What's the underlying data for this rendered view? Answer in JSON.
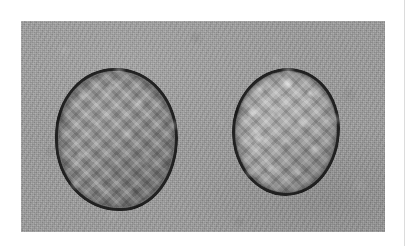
{
  "page": {
    "background_color": "#ffffff",
    "width": 411,
    "height": 246,
    "column_rule_color": "#dcdcdc"
  },
  "figure": {
    "kind": "photograph",
    "color_mode": "grayscale",
    "caption": "",
    "background_color": "#9c9c9c",
    "bounds": {
      "x": 21,
      "y": 21,
      "width": 364,
      "height": 211
    },
    "specimens": [
      {
        "id": "specimen-left",
        "position": "left",
        "shape": "round",
        "surface_tone": "#8e8e8e",
        "rim_tone": "#141414",
        "surface_texture": "cross-hatched mottled crumb",
        "relative_size": "larger",
        "bounds": {
          "x": 55,
          "y": 68,
          "width": 123,
          "height": 143
        }
      },
      {
        "id": "specimen-right",
        "position": "right",
        "shape": "round",
        "surface_tone": "#a8a8a8",
        "rim_tone": "#141414",
        "surface_texture": "cross-hatched mottled crumb with bright highlights",
        "relative_size": "smaller",
        "bounds": {
          "x": 232,
          "y": 68,
          "width": 108,
          "height": 128
        }
      }
    ]
  }
}
